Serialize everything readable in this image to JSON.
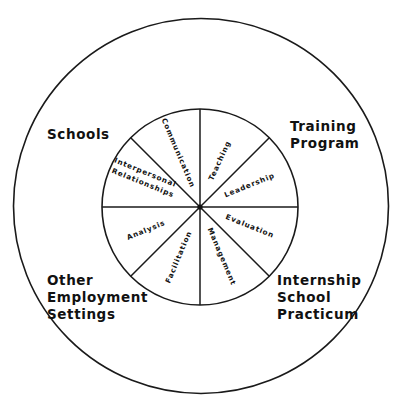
{
  "diagram": {
    "type": "concentric-wheel",
    "outer_circle": {
      "cx": 201,
      "cy": 206,
      "r": 188
    },
    "inner_circle": {
      "cx": 200,
      "cy": 207,
      "r": 98
    },
    "spoke_count": 8,
    "colors": {
      "line": "#1a1a1a",
      "text": "#111111",
      "background": "#ffffff"
    },
    "settings": [
      {
        "id": "schools",
        "lines": [
          "Schools"
        ]
      },
      {
        "id": "training-program",
        "lines": [
          "Training",
          "Program"
        ]
      },
      {
        "id": "other-employment-settings",
        "lines": [
          "Other",
          "Employment",
          "Settings"
        ]
      },
      {
        "id": "internship-school-practicum",
        "lines": [
          "Internship",
          "School",
          "Practicum"
        ]
      }
    ],
    "competencies": [
      {
        "id": "communication",
        "lines": [
          "Communication"
        ]
      },
      {
        "id": "teaching",
        "lines": [
          "Teaching"
        ]
      },
      {
        "id": "leadership",
        "lines": [
          "Leadership"
        ]
      },
      {
        "id": "evaluation",
        "lines": [
          "Evaluation"
        ]
      },
      {
        "id": "management",
        "lines": [
          "Management"
        ]
      },
      {
        "id": "facilitation",
        "lines": [
          "Facilitation"
        ]
      },
      {
        "id": "analysis",
        "lines": [
          "Analysis"
        ]
      },
      {
        "id": "interpersonal-relationships",
        "lines": [
          "Interpersonal",
          "Relationships"
        ]
      }
    ]
  }
}
